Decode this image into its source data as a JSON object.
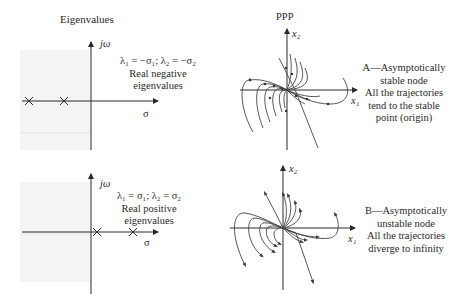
{
  "left_column": {
    "title": "Eigenvalues"
  },
  "panel_a": {
    "eigen_plot": {
      "axis_imag_label": "jω",
      "axis_real_label": "σ",
      "equation": "λ₁ = −σ₁;  λ₂ = −σ₂",
      "caption_line1": "Real negative",
      "caption_line2": "eigenvalues",
      "eigenvalue_markers": [
        "×",
        "×"
      ],
      "marker_positions": "left half-plane on real axis"
    },
    "phase_portrait": {
      "title": "PPP",
      "x_axis_label": "x₁",
      "y_axis_label": "x₂"
    },
    "description": {
      "line1": "A—Asymptotically",
      "line2": "stable node",
      "line3": "All the trajectories",
      "line4": "tend to the stable",
      "line5": "point (origin)"
    }
  },
  "panel_b": {
    "eigen_plot": {
      "axis_imag_label": "jω",
      "axis_real_label": "σ",
      "equation": "λ₁ = σ₁;  λ₂ = σ₂",
      "caption_line1": "Real positive",
      "caption_line2": "eigenvalues",
      "eigenvalue_markers": [
        "×",
        "×"
      ],
      "marker_positions": "right half-plane on real axis"
    },
    "phase_portrait": {
      "x_axis_label": "x₁",
      "y_axis_label": "x₂"
    },
    "description": {
      "line1": "B—Asymptotically",
      "line2": "unstable node",
      "line3": "All the trajectories",
      "line4": "diverge to infinity"
    }
  },
  "colors": {
    "ink": "#2a2a2a",
    "shade": "#f3f3f3",
    "background": "#ffffff"
  }
}
